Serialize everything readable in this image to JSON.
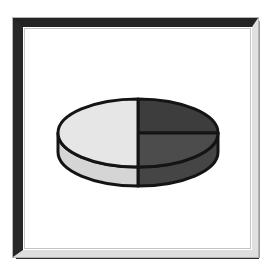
{
  "canvas": {
    "background": "#ffffff"
  },
  "frame": {
    "style": "beveled-metallic",
    "band_dark_top": "#232323",
    "band_dark_left": "#282828",
    "band_light_right": "#e0e0e0",
    "band_light_bottom": "#dedede",
    "outer_fringe": "#b4b4b4",
    "outer_edge_dark": "#2b2b2b",
    "inner_line": "#c4c4c4",
    "interior_background": "#ffffff"
  },
  "chart_data": {
    "type": "pie",
    "style": "3d",
    "title": "",
    "xlabel": "",
    "ylabel": "",
    "legend": false,
    "labels_visible": false,
    "start_angle_deg": -90,
    "direction": "clockwise",
    "outline_color": "#141414",
    "outline_width": 3,
    "slices": [
      {
        "name": "pie-slice-top-right",
        "percent": 25,
        "top_color": "#3d3d3d",
        "side_color": "#474747"
      },
      {
        "name": "pie-slice-bottom-right",
        "percent": 25,
        "top_color": "#4c4c4c",
        "side_color": "#454545"
      },
      {
        "name": "pie-slice-left",
        "percent": 50,
        "top_color": "#e6e6e6",
        "side_color": "#d5d5d5"
      }
    ],
    "geometry": {
      "cx": 138,
      "cy": 133,
      "rx": 80,
      "ry": 34,
      "depth": 19
    }
  }
}
